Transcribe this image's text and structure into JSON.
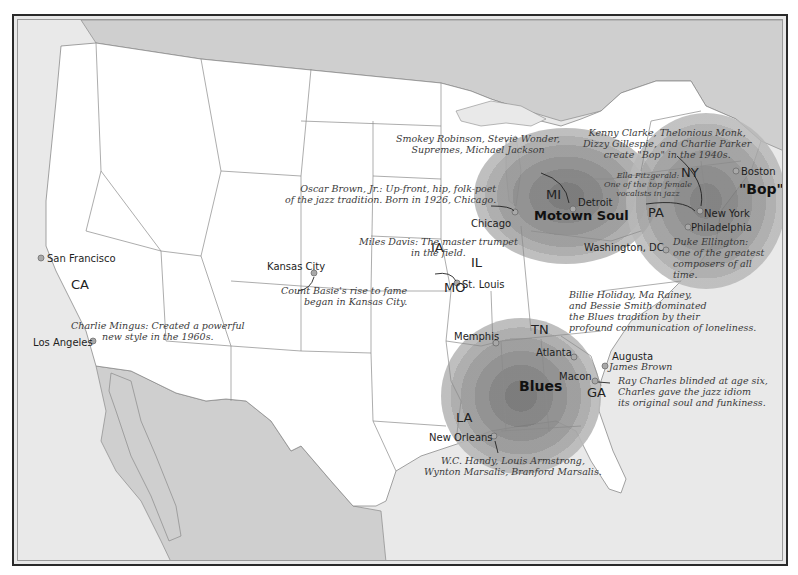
{
  "map": {
    "title": "Jazz in America",
    "colors": {
      "land": "#ffffff",
      "water": "#e9e9e9",
      "foreign_land": "#cfcfcf",
      "hotspot_ring": "#8c8c8c",
      "border_lines": "#8a8a8a",
      "frame": "#2a2a2a"
    },
    "regions": {
      "motown": "Motown Soul",
      "bop_coast": "\"Bop\" Coast",
      "blues": "Blues"
    },
    "states": {
      "ca": "CA",
      "ia": "IA",
      "il": "IL",
      "mo": "MO",
      "mi": "MI",
      "pa": "PA",
      "ny": "NY",
      "tn": "TN",
      "ga": "GA",
      "la": "LA"
    },
    "cities": {
      "san_francisco": "San Francisco",
      "los_angeles": "Los Angeles",
      "kansas_city": "Kansas City",
      "st_louis": "St. Louis",
      "chicago": "Chicago",
      "detroit": "Detroit",
      "washington_dc": "Washington, DC",
      "philadelphia": "Philadelphia",
      "new_york": "New York",
      "boston": "Boston",
      "memphis": "Memphis",
      "atlanta": "Atlanta",
      "macon": "Macon",
      "augusta": "Augusta",
      "new_orleans": "New Orleans"
    },
    "annotations": {
      "motown_line1": "Smokey Robinson, Stevie Wonder,",
      "motown_line2": "Supremes, Michael Jackson",
      "bop_line1": "Kenny Clarke, Thelonious Monk,",
      "bop_line2": "Dizzy Gillespie, and Charlie Parker",
      "bop_line3": "create \"Bop\" in the 1940s.",
      "ella_line1": "Ella Fitzgerald:",
      "ella_line2": "One of the top female",
      "ella_line3": "vocalists in jazz",
      "oscar_line1": "Oscar Brown, Jr.: Up-front, hip, folk-poet",
      "oscar_line2": "of the jazz tradition. Born in 1926, Chicago.",
      "miles_line1": "Miles Davis: The master trumpet",
      "miles_line2": "in the field.",
      "basie_line1": "Count Basie's rise to fame",
      "basie_line2": "began in Kansas City.",
      "mingus_line1": "Charlie Mingus: Created a powerful",
      "mingus_line2": "new style in the 1960s.",
      "ellington_line1": "Duke Ellington:",
      "ellington_line2": "one of the greatest",
      "ellington_line3": "composers of all",
      "ellington_line4": "time.",
      "billie_line1": "Billie Holiday, Ma Rainey,",
      "billie_line2": "and Bessie Smith dominated",
      "billie_line3": "the Blues tradition by their",
      "billie_line4": "profound communication of loneliness.",
      "james_brown": "James Brown",
      "ray_line1": "Ray Charles blinded at age six,",
      "ray_line2": "Charles gave the jazz idiom",
      "ray_line3": "its original soul and funkiness.",
      "nola_line1": "W.C. Handy, Louis Armstrong,",
      "nola_line2": "Wynton Marsalis, Branford Marsalis."
    }
  }
}
